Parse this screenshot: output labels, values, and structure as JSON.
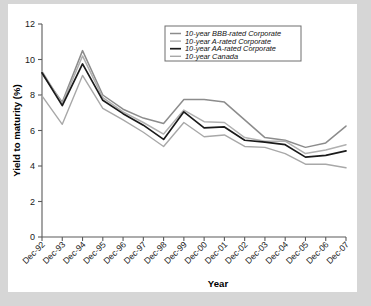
{
  "chart_data": {
    "type": "line",
    "title": "",
    "xlabel": "Year",
    "ylabel": "Yield to maturity (%)",
    "ylim": [
      0,
      12
    ],
    "yticks": [
      0,
      2,
      4,
      6,
      8,
      10,
      12
    ],
    "grid": false,
    "legend_position": "upper-center",
    "categories": [
      "Dec-92",
      "Dec-93",
      "Dec-94",
      "Dec-95",
      "Dec-96",
      "Dec-97",
      "Dec-98",
      "Dec-99",
      "Dec-00",
      "Dec-01",
      "Dec-02",
      "Dec-03",
      "Dec-04",
      "Dec-05",
      "Dec-06",
      "Dec-07"
    ],
    "series": [
      {
        "name": "10-year BBB-rated Corporate",
        "color": "#8c8c8c",
        "width": 1.5,
        "values": [
          9.2,
          7.6,
          10.5,
          8.0,
          7.2,
          6.7,
          6.4,
          7.75,
          7.75,
          7.6,
          6.6,
          5.6,
          5.45,
          5.05,
          5.3,
          6.25
        ]
      },
      {
        "name": "10-year A-rated Corporate",
        "color": "#b0b0b0",
        "width": 1.5,
        "values": [
          9.35,
          7.5,
          10.2,
          7.85,
          7.05,
          6.45,
          5.8,
          7.15,
          6.5,
          6.45,
          5.6,
          5.4,
          5.4,
          4.7,
          4.9,
          5.2
        ]
      },
      {
        "name": "10-year AA-rated Corporate",
        "color": "#1a1a1a",
        "width": 1.7,
        "values": [
          9.25,
          7.4,
          9.75,
          7.7,
          6.95,
          6.3,
          5.5,
          7.05,
          6.15,
          6.2,
          5.45,
          5.35,
          5.2,
          4.5,
          4.6,
          4.85
        ]
      },
      {
        "name": "10-year Canada",
        "color": "#a8a8a8",
        "width": 1.4,
        "values": [
          7.95,
          6.35,
          9.1,
          7.25,
          6.6,
          5.9,
          5.1,
          6.45,
          5.65,
          5.75,
          5.1,
          5.05,
          4.7,
          4.1,
          4.1,
          3.9
        ]
      }
    ]
  }
}
